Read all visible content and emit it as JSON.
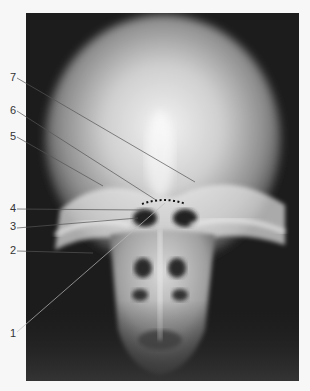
{
  "figure": {
    "labels": [
      {
        "id": "7",
        "text": "7",
        "x": 10,
        "y": 77,
        "target": [
          195,
          182
        ]
      },
      {
        "id": "6",
        "text": "6",
        "x": 10,
        "y": 110,
        "target": [
          156,
          200
        ]
      },
      {
        "id": "5",
        "text": "5",
        "x": 10,
        "y": 136,
        "target": [
          103,
          186
        ]
      },
      {
        "id": "4",
        "text": "4",
        "x": 10,
        "y": 208,
        "target": [
          144,
          210
        ]
      },
      {
        "id": "3",
        "text": "3",
        "x": 10,
        "y": 226,
        "target": [
          138,
          218
        ]
      },
      {
        "id": "2",
        "text": "2",
        "x": 10,
        "y": 250,
        "target": [
          93,
          252
        ]
      },
      {
        "id": "1",
        "text": "1",
        "x": 10,
        "y": 333,
        "target": [
          165,
          203
        ]
      }
    ],
    "dotted_marker": {
      "x1": 142,
      "x2": 186,
      "y": 203
    },
    "colors": {
      "background": "#f7f7f7",
      "film": "#1a1a1a",
      "bone": "#e8e8e8",
      "leader_line": "#555555"
    }
  }
}
